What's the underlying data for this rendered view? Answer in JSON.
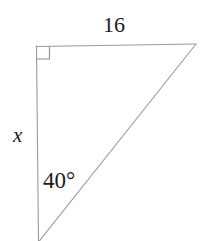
{
  "figure": {
    "type": "right-triangle-diagram",
    "background_color": "#ffffff",
    "stroke_color": "#9a9a9a",
    "text_color": "#1a1a1a",
    "labels": {
      "top_side": "16",
      "left_side": "x",
      "angle": "40°"
    },
    "geometry": {
      "vertices": {
        "top_left": [
          36,
          46
        ],
        "top_right": [
          196,
          44
        ],
        "bottom": [
          38,
          241
        ]
      },
      "right_angle_marker": {
        "at_vertex": "top_left",
        "size": 13
      }
    }
  }
}
